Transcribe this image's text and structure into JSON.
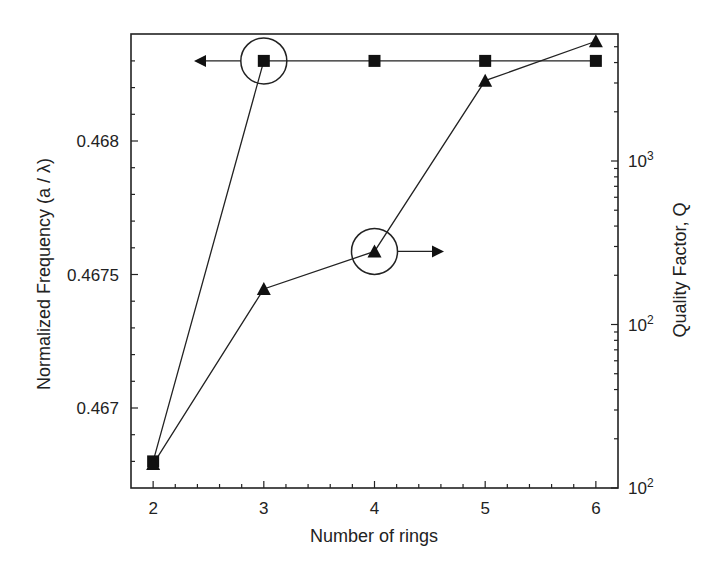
{
  "chart_data": {
    "type": "line",
    "title": "",
    "xlabel": "Number of rings",
    "ylabel": "Normalized Frequency (a / λ)",
    "ylabel_right": "Quality Factor, Q",
    "x": [
      2,
      3,
      4,
      5,
      6
    ],
    "xlim": [
      1.8,
      6.2
    ],
    "xticks": [
      "2",
      "3",
      "4",
      "5",
      "6"
    ],
    "ylim_left": [
      0.46658,
      0.4683
    ],
    "yticks_left": [
      "0.467",
      "0.4675",
      "0.468"
    ],
    "ylim_right_log10": [
      1,
      3.78
    ],
    "yticks_right": [
      {
        "label": "10",
        "sup": "2",
        "log": 1
      },
      {
        "label": "10",
        "sup": "2",
        "log": 2
      },
      {
        "label": "10",
        "sup": "3",
        "log": 3
      }
    ],
    "grid": false,
    "series": [
      {
        "name": "Normalized Frequency",
        "marker": "square",
        "axis": "left",
        "values": [
          0.4668,
          0.4683,
          0.4683,
          0.4683,
          0.4683
        ]
      },
      {
        "name": "Quality Factor Q",
        "marker": "triangle",
        "axis": "right",
        "values": [
          14,
          165,
          280,
          3100,
          5400
        ]
      }
    ],
    "annotations": [
      {
        "type": "circle",
        "target": "Normalized Frequency at 3 rings",
        "arrow": "left"
      },
      {
        "type": "circle",
        "target": "Quality Factor at 4 rings",
        "arrow": "right"
      }
    ]
  }
}
